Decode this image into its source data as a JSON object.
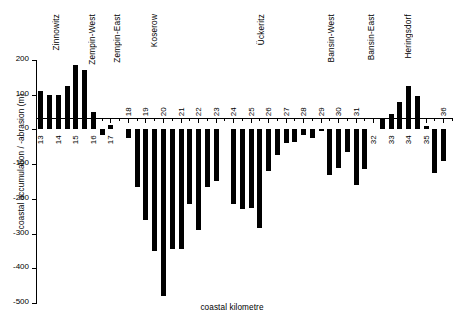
{
  "chart_data": {
    "type": "bar",
    "title": "",
    "xlabel": "coastal kilometre",
    "ylabel": "coastal accumulation / -abrasion (m)",
    "ylim": [
      -500,
      200
    ],
    "yticks": [
      200,
      100,
      0,
      -100,
      -200,
      -300,
      -400,
      -500
    ],
    "ytick_labels": [
      "200",
      "100",
      "0",
      "-100",
      "-200",
      "-300",
      "-400",
      "-500"
    ],
    "xlim": [
      12.75,
      36.5
    ],
    "xticks": [
      13,
      14,
      15,
      16,
      17,
      18,
      19,
      20,
      21,
      22,
      23,
      24,
      25,
      26,
      27,
      28,
      29,
      30,
      31,
      32,
      33,
      34,
      35,
      36
    ],
    "xtick_labels": [
      "13",
      "14",
      "15",
      "16",
      "17",
      "18",
      "19",
      "20",
      "21",
      "22",
      "23",
      "24",
      "25",
      "26",
      "27",
      "28",
      "29",
      "30",
      "31",
      "32",
      "33",
      "34",
      "35",
      "36"
    ],
    "grid": false,
    "legend": false,
    "bar_color": "#000000",
    "background": "#ffffff",
    "x": [
      13.0,
      13.5,
      14.0,
      14.5,
      15.0,
      15.5,
      16.0,
      16.5,
      17.0,
      17.5,
      18.0,
      18.5,
      19.0,
      19.5,
      20.0,
      20.5,
      21.0,
      21.5,
      22.0,
      22.5,
      23.0,
      23.5,
      24.0,
      24.5,
      25.0,
      25.5,
      26.0,
      26.5,
      27.0,
      27.5,
      28.0,
      28.5,
      29.0,
      29.5,
      30.0,
      30.5,
      31.0,
      31.5,
      32.0,
      32.5,
      33.0,
      33.5,
      34.0,
      34.5,
      35.0,
      35.5,
      36.0
    ],
    "values": [
      110,
      100,
      100,
      125,
      185,
      170,
      50,
      -15,
      12,
      0,
      -25,
      -165,
      -260,
      -350,
      -480,
      -345,
      -345,
      -215,
      -290,
      -165,
      -150,
      0,
      -215,
      -230,
      -225,
      -285,
      -120,
      -75,
      -40,
      -35,
      -15,
      -25,
      -5,
      -130,
      -110,
      -65,
      -160,
      -115,
      0,
      30,
      45,
      80,
      125,
      95,
      10,
      -125,
      -90
    ],
    "series_name": "coastal accumulation / abrasion",
    "annotations": [
      {
        "label": "Zinnowitz",
        "x": 13.9
      },
      {
        "label": "Zempin-West",
        "x": 15.95
      },
      {
        "label": "Zempin-East",
        "x": 17.4
      },
      {
        "label": "Koserow",
        "x": 19.5
      },
      {
        "label": "Ückeritz",
        "x": 25.6
      },
      {
        "label": "Bansin-West",
        "x": 29.6
      },
      {
        "label": "Bansin-East",
        "x": 31.9
      },
      {
        "label": "Heringsdorf",
        "x": 34.0
      }
    ]
  }
}
